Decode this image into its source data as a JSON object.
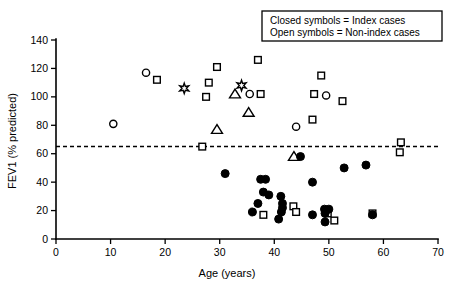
{
  "chart_data": {
    "type": "scatter",
    "title": "",
    "xlabel": "Age (years)",
    "ylabel": "FEV1 (% predicted)",
    "xlim": [
      0,
      70
    ],
    "ylim": [
      0,
      140
    ],
    "xticks": [
      0,
      10,
      20,
      30,
      40,
      50,
      60,
      70
    ],
    "yticks": [
      0,
      20,
      40,
      60,
      80,
      100,
      120,
      140
    ],
    "grid": false,
    "legend_position": "top-right",
    "annotations": [
      {
        "name": "threshold-line",
        "type": "hline",
        "y": 65,
        "style": "dashed"
      }
    ],
    "legend": [
      "Closed symbols = Index cases",
      "Open symbols = Non-index cases"
    ],
    "series": [
      {
        "name": "Non-index cases (open circle)",
        "marker": "open-circle",
        "points": [
          [
            10.5,
            81
          ],
          [
            16.5,
            117
          ],
          [
            35.5,
            102
          ],
          [
            44.0,
            79
          ],
          [
            49.5,
            101
          ]
        ]
      },
      {
        "name": "Non-index cases (open square)",
        "marker": "open-square",
        "points": [
          [
            18.5,
            112
          ],
          [
            27.5,
            100
          ],
          [
            28.0,
            110
          ],
          [
            29.5,
            121
          ],
          [
            37.0,
            126
          ],
          [
            37.5,
            102
          ],
          [
            26.8,
            65
          ],
          [
            47.3,
            102
          ],
          [
            48.6,
            115
          ],
          [
            47.0,
            84
          ],
          [
            52.5,
            97
          ],
          [
            63.2,
            68
          ],
          [
            63.0,
            61
          ],
          [
            38.0,
            17
          ],
          [
            43.5,
            23
          ],
          [
            44.0,
            19
          ],
          [
            51.0,
            13
          ],
          [
            49.8,
            18
          ],
          [
            58.0,
            18
          ]
        ]
      },
      {
        "name": "Non-index cases (open triangle)",
        "marker": "open-triangle",
        "points": [
          [
            29.5,
            77
          ],
          [
            32.8,
            102
          ],
          [
            35.3,
            89
          ],
          [
            43.6,
            58
          ]
        ]
      },
      {
        "name": "Non-index cases (star)",
        "marker": "star",
        "points": [
          [
            23.5,
            106
          ],
          [
            34.0,
            108
          ]
        ]
      },
      {
        "name": "Index cases (closed circle)",
        "marker": "closed-circle",
        "points": [
          [
            44.8,
            58
          ],
          [
            31.0,
            46
          ],
          [
            37.5,
            42
          ],
          [
            38.4,
            42
          ],
          [
            38.0,
            33
          ],
          [
            39.0,
            31
          ],
          [
            37.0,
            25
          ],
          [
            36.0,
            19
          ],
          [
            41.2,
            30
          ],
          [
            41.5,
            25
          ],
          [
            41.5,
            22
          ],
          [
            41.3,
            19
          ],
          [
            40.8,
            14
          ],
          [
            47.0,
            40
          ],
          [
            47.0,
            17
          ],
          [
            49.2,
            21
          ],
          [
            50.0,
            21
          ],
          [
            49.3,
            12
          ],
          [
            49.3,
            18
          ],
          [
            52.8,
            50
          ],
          [
            56.8,
            52
          ],
          [
            58.0,
            17
          ]
        ]
      }
    ]
  }
}
